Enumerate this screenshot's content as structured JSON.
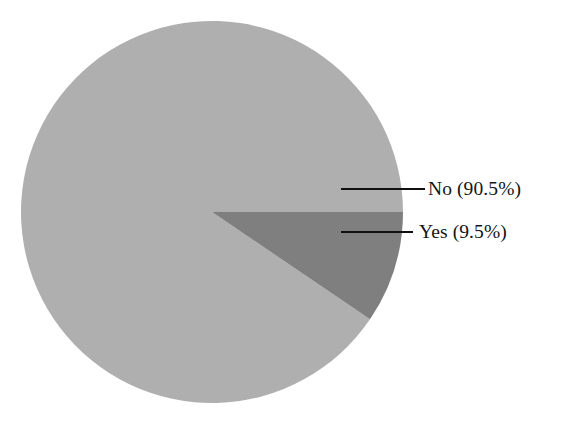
{
  "canvas": {
    "width": 568,
    "height": 429,
    "background": "#ffffff"
  },
  "chart_data": {
    "type": "pie",
    "title": "",
    "subtitle": "",
    "xlabel": "",
    "ylabel": "",
    "legend_position": "none",
    "grid": false,
    "labels_outside": true,
    "total_degrees": 360,
    "start_angle_deg": 0,
    "direction": "clockwise",
    "categories": [
      "No",
      "Yes"
    ],
    "values": [
      90.5,
      9.5
    ],
    "value_unit": "percent",
    "slices": [
      {
        "name": "No",
        "value": 90.5,
        "value_text": "90.5%",
        "label": "No (90.5%)",
        "color": "#afafaf",
        "start_angle_deg": 34.2,
        "end_angle_deg": 360,
        "sweep_deg": 325.8,
        "leader_line": {
          "x1": 341,
          "y1": 189,
          "x2": 425,
          "y2": 189
        },
        "label_pos": {
          "x": 428,
          "y": 189
        }
      },
      {
        "name": "Yes",
        "value": 9.5,
        "value_text": "9.5%",
        "label": "Yes (9.5%)",
        "color": "#7f7f7f",
        "start_angle_deg": 0,
        "end_angle_deg": 34.2,
        "sweep_deg": 34.2,
        "leader_line": {
          "x1": 341,
          "y1": 232,
          "x2": 413,
          "y2": 232
        },
        "label_pos": {
          "x": 419,
          "y": 232
        }
      }
    ],
    "geometry": {
      "center_x": 212,
      "center_y": 212,
      "radius": 191
    },
    "colors": {
      "slice_no": "#afafaf",
      "slice_yes": "#7f7f7f",
      "leader_line": "#101010",
      "text": "#151515",
      "background": "#ffffff"
    }
  },
  "labels": {
    "no": "No (90.5%)",
    "yes": "Yes (9.5%)"
  }
}
